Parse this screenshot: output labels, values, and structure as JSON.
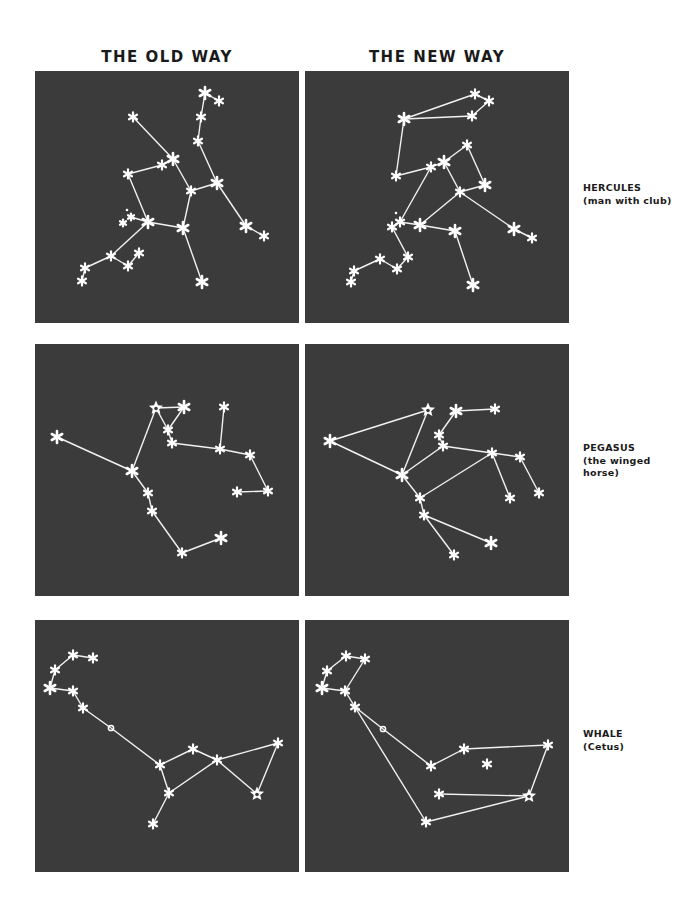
{
  "header": {
    "old_way": "THE OLD WAY",
    "new_way": "THE NEW WAY"
  },
  "colors": {
    "panel_bg": "#3b3b3b",
    "star": "#ffffff",
    "line": "#f2f2f2",
    "text": "#1a1a1a"
  },
  "rows": [
    {
      "name": "HERCULES",
      "subtitle": "(man with club)",
      "subtitle_lines": [
        "(man with club)"
      ],
      "old": {
        "stars": [
          [
            170,
            22,
            "big"
          ],
          [
            184,
            30,
            "m"
          ],
          [
            166,
            46,
            "m"
          ],
          [
            163,
            70,
            "m"
          ],
          [
            98,
            46,
            "m"
          ],
          [
            138,
            88,
            "big"
          ],
          [
            127,
            94,
            "m"
          ],
          [
            93,
            103,
            "m"
          ],
          [
            182,
            112,
            "big"
          ],
          [
            156,
            120,
            "m"
          ],
          [
            113,
            151,
            "big"
          ],
          [
            96,
            146,
            "s"
          ],
          [
            88,
            152,
            "s"
          ],
          [
            92,
            139,
            "dot"
          ],
          [
            148,
            157,
            "big"
          ],
          [
            211,
            155,
            "big"
          ],
          [
            229,
            165,
            "m"
          ],
          [
            76,
            185,
            "m"
          ],
          [
            104,
            182,
            "m"
          ],
          [
            93,
            195,
            "m"
          ],
          [
            50,
            197,
            "m"
          ],
          [
            47,
            210,
            "m"
          ],
          [
            167,
            211,
            "big"
          ]
        ],
        "edges": [
          [
            0,
            1
          ],
          [
            0,
            2
          ],
          [
            2,
            3
          ],
          [
            3,
            8
          ],
          [
            8,
            15
          ],
          [
            15,
            16
          ],
          [
            8,
            9
          ],
          [
            4,
            5
          ],
          [
            5,
            9
          ],
          [
            7,
            6
          ],
          [
            6,
            5
          ],
          [
            7,
            10
          ],
          [
            10,
            14
          ],
          [
            9,
            14
          ],
          [
            14,
            22
          ],
          [
            10,
            11
          ],
          [
            10,
            17
          ],
          [
            17,
            20
          ],
          [
            20,
            21
          ],
          [
            17,
            19
          ],
          [
            19,
            18
          ]
        ]
      },
      "new": {
        "stars": [
          [
            170,
            23,
            "m"
          ],
          [
            184,
            30,
            "m"
          ],
          [
            167,
            45,
            "m"
          ],
          [
            99,
            48,
            "big"
          ],
          [
            162,
            74,
            "m"
          ],
          [
            139,
            91,
            "big"
          ],
          [
            126,
            96,
            "m"
          ],
          [
            91,
            105,
            "m"
          ],
          [
            180,
            114,
            "big"
          ],
          [
            155,
            121,
            "m"
          ],
          [
            95,
            151,
            "m"
          ],
          [
            87,
            156,
            "m"
          ],
          [
            91,
            142,
            "dot"
          ],
          [
            115,
            154,
            "big"
          ],
          [
            150,
            160,
            "big"
          ],
          [
            209,
            158,
            "big"
          ],
          [
            227,
            167,
            "m"
          ],
          [
            103,
            186,
            "m"
          ],
          [
            75,
            188,
            "m"
          ],
          [
            92,
            198,
            "m"
          ],
          [
            49,
            200,
            "m"
          ],
          [
            46,
            211,
            "m"
          ],
          [
            168,
            214,
            "big"
          ]
        ],
        "edges": [
          [
            3,
            0
          ],
          [
            0,
            1
          ],
          [
            1,
            2
          ],
          [
            2,
            3
          ],
          [
            3,
            7
          ],
          [
            7,
            6
          ],
          [
            6,
            5
          ],
          [
            5,
            4
          ],
          [
            4,
            8
          ],
          [
            8,
            9
          ],
          [
            5,
            9
          ],
          [
            9,
            15
          ],
          [
            15,
            16
          ],
          [
            9,
            13
          ],
          [
            6,
            10
          ],
          [
            10,
            13
          ],
          [
            13,
            14
          ],
          [
            14,
            22
          ],
          [
            10,
            11
          ],
          [
            11,
            17
          ],
          [
            17,
            19
          ],
          [
            19,
            18
          ],
          [
            18,
            20
          ],
          [
            20,
            21
          ]
        ]
      }
    },
    {
      "name": "PEGASUS",
      "subtitle": "(the winged horse)",
      "subtitle_lines": [
        "(the winged",
        "horse)"
      ],
      "old": {
        "stars": [
          [
            22,
            93,
            "big"
          ],
          [
            97,
            127,
            "big"
          ],
          [
            121,
            64,
            "hollow"
          ],
          [
            149,
            63,
            "big"
          ],
          [
            133,
            86,
            "m"
          ],
          [
            137,
            99,
            "m"
          ],
          [
            189,
            63,
            "m"
          ],
          [
            185,
            105,
            "m"
          ],
          [
            215,
            111,
            "m"
          ],
          [
            233,
            147,
            "m"
          ],
          [
            202,
            148,
            "m"
          ],
          [
            113,
            149,
            "m"
          ],
          [
            117,
            167,
            "m"
          ],
          [
            147,
            209,
            "m"
          ],
          [
            186,
            194,
            "big"
          ]
        ],
        "edges": [
          [
            0,
            1
          ],
          [
            1,
            2
          ],
          [
            2,
            3
          ],
          [
            3,
            4
          ],
          [
            2,
            4
          ],
          [
            4,
            5
          ],
          [
            5,
            7
          ],
          [
            6,
            7
          ],
          [
            7,
            8
          ],
          [
            8,
            9
          ],
          [
            9,
            10
          ],
          [
            1,
            11
          ],
          [
            11,
            12
          ],
          [
            12,
            13
          ],
          [
            13,
            14
          ]
        ]
      },
      "new": {
        "stars": [
          [
            25,
            97,
            "big"
          ],
          [
            123,
            66,
            "hollow"
          ],
          [
            97,
            131,
            "big"
          ],
          [
            151,
            67,
            "big"
          ],
          [
            190,
            65,
            "m"
          ],
          [
            134,
            91,
            "m"
          ],
          [
            138,
            102,
            "m"
          ],
          [
            187,
            109,
            "m"
          ],
          [
            215,
            113,
            "m"
          ],
          [
            234,
            149,
            "m"
          ],
          [
            205,
            154,
            "m"
          ],
          [
            115,
            154,
            "m"
          ],
          [
            119,
            171,
            "m"
          ],
          [
            186,
            199,
            "big"
          ],
          [
            149,
            211,
            "m"
          ]
        ],
        "edges": [
          [
            0,
            1
          ],
          [
            0,
            2
          ],
          [
            1,
            2
          ],
          [
            3,
            4
          ],
          [
            3,
            5
          ],
          [
            5,
            6
          ],
          [
            6,
            2
          ],
          [
            6,
            7
          ],
          [
            7,
            8
          ],
          [
            8,
            9
          ],
          [
            7,
            10
          ],
          [
            7,
            11
          ],
          [
            2,
            11
          ],
          [
            11,
            12
          ],
          [
            12,
            13
          ],
          [
            12,
            14
          ]
        ]
      }
    },
    {
      "name": "WHALE",
      "subtitle": "(Cetus)",
      "subtitle_lines": [
        "(Cetus)"
      ],
      "old": {
        "stars": [
          [
            38,
            35,
            "m"
          ],
          [
            58,
            38,
            "m"
          ],
          [
            20,
            50,
            "m"
          ],
          [
            15,
            68,
            "big"
          ],
          [
            38,
            71,
            "m"
          ],
          [
            48,
            88,
            "m"
          ],
          [
            76,
            108,
            "circle"
          ],
          [
            125,
            145,
            "m"
          ],
          [
            158,
            129,
            "m"
          ],
          [
            182,
            140,
            "m"
          ],
          [
            243,
            123,
            "m"
          ],
          [
            222,
            174,
            "hollow"
          ],
          [
            134,
            173,
            "m"
          ],
          [
            118,
            204,
            "m"
          ]
        ],
        "edges": [
          [
            0,
            1
          ],
          [
            0,
            2
          ],
          [
            2,
            3
          ],
          [
            3,
            4
          ],
          [
            4,
            5
          ],
          [
            5,
            6
          ],
          [
            6,
            7
          ],
          [
            7,
            8
          ],
          [
            8,
            9
          ],
          [
            9,
            10
          ],
          [
            10,
            11
          ],
          [
            9,
            11
          ],
          [
            7,
            12
          ],
          [
            12,
            9
          ],
          [
            12,
            13
          ]
        ]
      },
      "new": {
        "stars": [
          [
            41,
            36,
            "m"
          ],
          [
            60,
            39,
            "m"
          ],
          [
            22,
            51,
            "m"
          ],
          [
            17,
            68,
            "big"
          ],
          [
            40,
            71,
            "m"
          ],
          [
            50,
            87,
            "m"
          ],
          [
            78,
            109,
            "circle"
          ],
          [
            126,
            146,
            "m"
          ],
          [
            159,
            129,
            "m"
          ],
          [
            182,
            144,
            "m"
          ],
          [
            243,
            125,
            "m"
          ],
          [
            224,
            176,
            "hollow"
          ],
          [
            134,
            174,
            "m"
          ],
          [
            121,
            202,
            "m"
          ]
        ],
        "edges": [
          [
            0,
            1
          ],
          [
            0,
            2
          ],
          [
            2,
            3
          ],
          [
            3,
            4
          ],
          [
            1,
            4
          ],
          [
            4,
            5
          ],
          [
            5,
            6
          ],
          [
            6,
            7
          ],
          [
            7,
            8
          ],
          [
            8,
            10
          ],
          [
            10,
            11
          ],
          [
            12,
            11
          ],
          [
            5,
            13
          ],
          [
            13,
            11
          ]
        ]
      }
    }
  ]
}
